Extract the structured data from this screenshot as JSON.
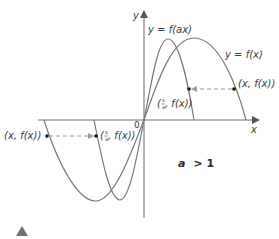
{
  "diagram": {
    "axes": {
      "x_label": "x",
      "y_label": "y",
      "origin_label": "0"
    },
    "curves": [
      {
        "id": "f_ax",
        "label": "y = f(ax)",
        "color": "#6e6e6e"
      },
      {
        "id": "f_x",
        "label": "y = f(x)",
        "color": "#6e6e6e"
      }
    ],
    "points": {
      "right_original": "(x, f(x))",
      "right_scaled_prefix": "(",
      "right_scaled_frac_num": "x",
      "right_scaled_frac_den": "a",
      "right_scaled_suffix": ", f(x))",
      "left_original": "(x, f(x))",
      "left_scaled_prefix": "(",
      "left_scaled_frac_num": "x",
      "left_scaled_frac_den": "a",
      "left_scaled_suffix": ", f(x))"
    },
    "condition": {
      "variable": "a",
      "relation": "> 1"
    },
    "colors": {
      "axis": "#6a6a6a",
      "curve": "#777777",
      "dashed_arrow": "#9a9a9a",
      "point": "#111111",
      "corner_marker": "#707070"
    }
  }
}
